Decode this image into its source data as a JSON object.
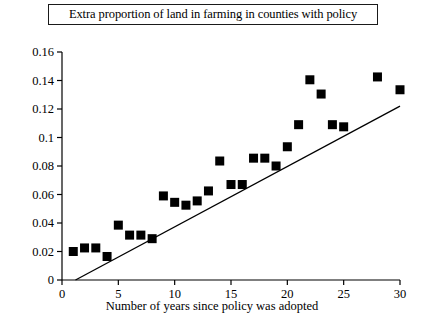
{
  "chart_data": {
    "type": "scatter",
    "title": "Extra proportion of land in farming in counties with policy",
    "xlabel": "Number of years since policy was adopted",
    "ylabel": "",
    "xlim": [
      0,
      30
    ],
    "ylim": [
      0,
      0.16
    ],
    "xticks": [
      0,
      5,
      10,
      15,
      20,
      25,
      30
    ],
    "xtick_labels": [
      "0",
      "5",
      "10",
      "15",
      "20",
      "25",
      "30"
    ],
    "yticks": [
      0,
      0.02,
      0.04,
      0.06,
      0.08,
      0.1,
      0.12,
      0.14,
      0.16
    ],
    "ytick_labels": [
      "0",
      "0.02",
      "0.04",
      "0.06",
      "0.08",
      "0.1",
      "0.12",
      "0.14",
      "0.16"
    ],
    "grid": false,
    "legend": false,
    "marker": "filled-square",
    "marker_color": "#000000",
    "x": [
      1,
      2,
      3,
      4,
      5,
      6,
      7,
      8,
      9,
      10,
      11,
      12,
      13,
      14,
      15,
      16,
      17,
      18,
      19,
      20,
      21,
      22,
      23,
      24,
      25,
      28,
      30
    ],
    "y": [
      0.02,
      0.0225,
      0.0225,
      0.0165,
      0.0385,
      0.0315,
      0.0315,
      0.029,
      0.059,
      0.0545,
      0.0525,
      0.0555,
      0.0625,
      0.0835,
      0.067,
      0.067,
      0.0855,
      0.0855,
      0.08,
      0.0935,
      0.109,
      0.1405,
      0.1305,
      0.109,
      0.1075,
      0.1425,
      0.1335
    ],
    "points": [
      {
        "x": 1,
        "y": 0.02
      },
      {
        "x": 2,
        "y": 0.0225
      },
      {
        "x": 3,
        "y": 0.0225
      },
      {
        "x": 4,
        "y": 0.0165
      },
      {
        "x": 5,
        "y": 0.0385
      },
      {
        "x": 6,
        "y": 0.0315
      },
      {
        "x": 7,
        "y": 0.0315
      },
      {
        "x": 8,
        "y": 0.029
      },
      {
        "x": 9,
        "y": 0.059
      },
      {
        "x": 10,
        "y": 0.0545
      },
      {
        "x": 11,
        "y": 0.0525
      },
      {
        "x": 12,
        "y": 0.0555
      },
      {
        "x": 13,
        "y": 0.0625
      },
      {
        "x": 14,
        "y": 0.0835
      },
      {
        "x": 15,
        "y": 0.067
      },
      {
        "x": 16,
        "y": 0.067
      },
      {
        "x": 17,
        "y": 0.0855
      },
      {
        "x": 18,
        "y": 0.0855
      },
      {
        "x": 19,
        "y": 0.08
      },
      {
        "x": 20,
        "y": 0.0935
      },
      {
        "x": 21,
        "y": 0.109
      },
      {
        "x": 22,
        "y": 0.1405
      },
      {
        "x": 23,
        "y": 0.1305
      },
      {
        "x": 24,
        "y": 0.109
      },
      {
        "x": 25,
        "y": 0.1075
      },
      {
        "x": 28,
        "y": 0.1425
      },
      {
        "x": 30,
        "y": 0.1335
      }
    ],
    "trendline": {
      "visible": true,
      "x0": 1.2,
      "y0": 0.0,
      "x1": 30.0,
      "y1": 0.122,
      "color": "#000000"
    }
  }
}
